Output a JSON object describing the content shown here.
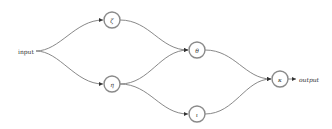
{
  "diagram": {
    "type": "directed-graph",
    "colors": {
      "stroke": "#8a8a8a",
      "edge": "#7a7a7a",
      "text": "#333333",
      "background": "#ffffff"
    },
    "labels": {
      "input": "input",
      "output": "output"
    },
    "nodes": [
      {
        "id": "zeta",
        "label": "ζ",
        "x": 112,
        "y": 20
      },
      {
        "id": "eta",
        "label": "η",
        "x": 112,
        "y": 84
      },
      {
        "id": "theta",
        "label": "θ",
        "x": 197,
        "y": 50
      },
      {
        "id": "iota",
        "label": "ι",
        "x": 197,
        "y": 114
      },
      {
        "id": "kappa",
        "label": "κ",
        "x": 280,
        "y": 79
      }
    ],
    "edges": [
      {
        "from": "input",
        "to": "zeta"
      },
      {
        "from": "input",
        "to": "eta"
      },
      {
        "from": "zeta",
        "to": "theta"
      },
      {
        "from": "eta",
        "to": "theta"
      },
      {
        "from": "eta",
        "to": "iota"
      },
      {
        "from": "theta",
        "to": "kappa"
      },
      {
        "from": "iota",
        "to": "kappa"
      },
      {
        "from": "kappa",
        "to": "output"
      }
    ]
  }
}
